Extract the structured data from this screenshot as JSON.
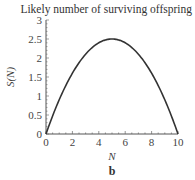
{
  "chart_data": {
    "type": "line",
    "title": "Likely number of surviving offspring",
    "xlabel": "N",
    "ylabel": "S(N)",
    "panel_label": "b",
    "xlim": [
      0,
      10
    ],
    "ylim": [
      0,
      3
    ],
    "x_ticks": [
      "0",
      "2",
      "4",
      "6",
      "8",
      "10"
    ],
    "y_ticks": [
      "0",
      "0.5",
      "1",
      "1.5",
      "2",
      "2.5",
      "3"
    ],
    "grid": false,
    "legend": null,
    "series": [
      {
        "name": "S(N)",
        "x": [
          0,
          1,
          2,
          3,
          4,
          5,
          6,
          7,
          8,
          9,
          10
        ],
        "values": [
          0,
          0.9,
          1.6,
          2.1,
          2.4,
          2.5,
          2.4,
          2.1,
          1.6,
          0.9,
          0
        ]
      }
    ]
  }
}
